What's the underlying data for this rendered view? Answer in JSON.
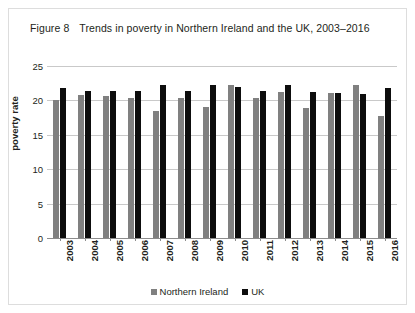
{
  "figure": {
    "label": "Figure 8",
    "title": "Trends in poverty in Northern Ireland and the UK, 2003–2016"
  },
  "legend": {
    "position": "bottom-center",
    "entries": [
      {
        "label": "Northern Ireland",
        "color": "#808080"
      },
      {
        "label": "UK",
        "color": "#0d0d0d"
      }
    ]
  },
  "chart_data": {
    "type": "bar",
    "title": "Trends in poverty in Northern Ireland and the UK, 2003–2016",
    "xlabel": "",
    "ylabel": "poverty rate",
    "ylim": [
      0,
      25
    ],
    "yticks": [
      0,
      5,
      10,
      15,
      20,
      25
    ],
    "ytick_labels": [
      "0",
      "5",
      "10",
      "15",
      "20",
      "25"
    ],
    "grid": true,
    "categories": [
      "2003",
      "2004",
      "2005",
      "2006",
      "2007",
      "2008",
      "2009",
      "2010",
      "2011",
      "2012",
      "2013",
      "2014",
      "2015",
      "2016"
    ],
    "series": [
      {
        "name": "Northern Ireland",
        "color": "#808080",
        "values": [
          20.0,
          20.8,
          20.6,
          20.4,
          18.5,
          20.4,
          19.1,
          22.2,
          20.4,
          21.2,
          18.9,
          21.1,
          22.3,
          17.8
        ]
      },
      {
        "name": "UK",
        "color": "#0d0d0d",
        "values": [
          21.8,
          21.3,
          21.3,
          21.4,
          22.3,
          21.3,
          22.2,
          21.9,
          21.3,
          22.3,
          21.2,
          21.1,
          21.0,
          21.8
        ]
      }
    ]
  }
}
